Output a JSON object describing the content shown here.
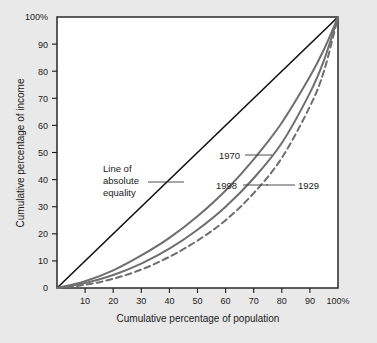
{
  "chart_data": {
    "type": "line",
    "title": "",
    "xlabel": "Cumulative percentage of population",
    "ylabel": "Cumulative percentage of income",
    "xlim": [
      0,
      100
    ],
    "ylim": [
      0,
      100
    ],
    "grid": false,
    "legend_position": "inline-annotations",
    "x_ticks": [
      0,
      10,
      20,
      30,
      40,
      50,
      60,
      70,
      80,
      90,
      100
    ],
    "y_ticks": [
      0,
      10,
      20,
      30,
      40,
      50,
      60,
      70,
      80,
      90,
      100
    ],
    "x_tick_labels": [
      "",
      "10",
      "20",
      "30",
      "40",
      "50",
      "60",
      "70",
      "80",
      "90",
      "100%"
    ],
    "y_tick_labels": [
      "0",
      "10",
      "20",
      "30",
      "40",
      "50",
      "60",
      "70",
      "80",
      "90",
      "100%"
    ],
    "series": [
      {
        "name": "Line of absolute equality",
        "style": "solid",
        "color": "#111111",
        "width": 1.6,
        "x": [
          0,
          100
        ],
        "values": [
          0,
          100
        ]
      },
      {
        "name": "1970",
        "style": "solid",
        "color": "#6e6e6e",
        "width": 2.0,
        "x": [
          0,
          10,
          20,
          30,
          40,
          50,
          60,
          70,
          80,
          90,
          95,
          100
        ],
        "values": [
          0,
          2.5,
          6.5,
          12.0,
          18.5,
          26.5,
          36.0,
          47.5,
          61.0,
          78.0,
          88.0,
          100
        ]
      },
      {
        "name": "1998",
        "style": "solid",
        "color": "#6e6e6e",
        "width": 2.0,
        "x": [
          0,
          10,
          20,
          30,
          40,
          50,
          60,
          70,
          80,
          90,
          95,
          100
        ],
        "values": [
          0,
          1.8,
          4.8,
          9.0,
          14.5,
          21.5,
          30.0,
          40.5,
          53.5,
          72.0,
          84.0,
          100
        ]
      },
      {
        "name": "1929",
        "style": "dashed",
        "color": "#6e6e6e",
        "width": 2.0,
        "x": [
          0,
          10,
          20,
          30,
          40,
          50,
          60,
          70,
          80,
          90,
          95,
          100
        ],
        "values": [
          0,
          1.2,
          3.4,
          6.8,
          11.5,
          17.5,
          25.0,
          35.0,
          48.0,
          67.0,
          80.0,
          100
        ]
      }
    ],
    "annotations": [
      {
        "id": "equality",
        "lines": [
          "Line of",
          "absolute",
          "equality"
        ],
        "text": "Line of absolute equality"
      },
      {
        "id": "y1970",
        "text": "1970"
      },
      {
        "id": "y1998",
        "text": "1998"
      },
      {
        "id": "y1929",
        "text": "1929"
      }
    ]
  },
  "figure": {
    "background_color": "#e9e9e9",
    "plot_background_color": "#ffffff",
    "axis_color": "#1a1a1a",
    "curve_color": "#6e6e6e",
    "equality_color": "#111111"
  }
}
